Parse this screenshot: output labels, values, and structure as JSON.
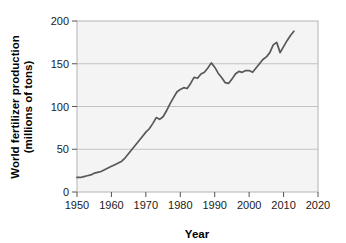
{
  "figure": {
    "background_color": "#ffffff",
    "plot_background_color": "#f4f4f4",
    "frame_color": "#b4b4b4",
    "grid_color": "#c3c3c3",
    "line_color": "#58585a",
    "text_color": "#000000"
  },
  "chart_data": {
    "type": "line",
    "title": "",
    "xlabel": "Year",
    "ylabel": "World fertilizer production (millions of tons)",
    "ylabel_line1": "World fertilizer production",
    "ylabel_line2": "(millions of tons)",
    "xlim": [
      1950,
      2020
    ],
    "ylim": [
      0,
      200
    ],
    "xticks": [
      1950,
      1960,
      1970,
      1980,
      1990,
      2000,
      2010,
      2020
    ],
    "xtick_labels": [
      "1950",
      "1960",
      "1970",
      "1980",
      "1990",
      "2000",
      "2010",
      "2020"
    ],
    "yticks": [
      0,
      50,
      100,
      150,
      200
    ],
    "ytick_labels": [
      "0",
      "50",
      "100",
      "150",
      "200"
    ],
    "grid": "horizontal",
    "legend": "none",
    "series": [
      {
        "name": "World fertilizer production",
        "units": "millions of tons",
        "x": [
          1950,
          1951,
          1952,
          1953,
          1954,
          1955,
          1956,
          1957,
          1958,
          1959,
          1960,
          1961,
          1962,
          1963,
          1964,
          1965,
          1966,
          1967,
          1968,
          1969,
          1970,
          1971,
          1972,
          1973,
          1974,
          1975,
          1976,
          1977,
          1978,
          1979,
          1980,
          1981,
          1982,
          1983,
          1984,
          1985,
          1986,
          1987,
          1988,
          1989,
          1990,
          1991,
          1992,
          1993,
          1994,
          1995,
          1996,
          1997,
          1998,
          1999,
          2000,
          2001,
          2002,
          2003,
          2004,
          2005,
          2006,
          2007,
          2008,
          2009,
          2010,
          2011,
          2012,
          2013
        ],
        "values": [
          17,
          17,
          18,
          19,
          20,
          22,
          23,
          24,
          26,
          28,
          30,
          32,
          34,
          36,
          40,
          45,
          50,
          55,
          60,
          65,
          70,
          74,
          80,
          87,
          85,
          88,
          95,
          103,
          110,
          117,
          120,
          122,
          121,
          127,
          134,
          133,
          138,
          140,
          145,
          151,
          146,
          139,
          134,
          128,
          127,
          132,
          138,
          141,
          140,
          142,
          142,
          140,
          145,
          150,
          155,
          158,
          163,
          172,
          175,
          163,
          170,
          177,
          183,
          188
        ]
      }
    ]
  }
}
